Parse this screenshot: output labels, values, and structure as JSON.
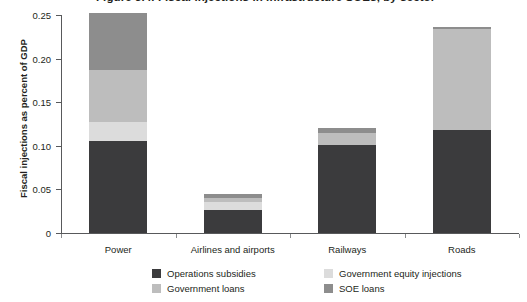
{
  "figure": {
    "title": "Figure 3.4. Fiscal injections in infrastructure SOEs, by sector",
    "title_bullet": "",
    "y_axis_title": "Fiscal injections as percent of GDP"
  },
  "chart_data": {
    "type": "bar",
    "stacked": true,
    "title": "Figure 3.4. Fiscal injections in infrastructure SOEs, by sector",
    "xlabel": "",
    "ylabel": "Fiscal injections as percent of GDP",
    "ylim": [
      0,
      0.25
    ],
    "grid": false,
    "legend_position": "bottom",
    "categories": [
      "Power",
      "Airlines and airports",
      "Railways",
      "Roads"
    ],
    "ytick_labels": [
      "0",
      "0.05",
      "0.10",
      "0.15",
      "0.20",
      "0.25"
    ],
    "ytick_values": [
      0,
      0.05,
      0.1,
      0.15,
      0.2,
      0.25
    ],
    "series": [
      {
        "name": "Operations subsidies",
        "color": "#3b3b3d",
        "values": [
          0.105,
          0.026,
          0.101,
          0.118
        ]
      },
      {
        "name": "Government equity injections",
        "color": "#dcdcdc",
        "values": [
          0.022,
          0.009,
          0.0,
          0.0
        ]
      },
      {
        "name": "Government loans",
        "color": "#bdbdbd",
        "values": [
          0.06,
          0.005,
          0.014,
          0.116
        ]
      },
      {
        "name": "SOE loans",
        "color": "#8d8d8d",
        "values": [
          0.065,
          0.005,
          0.006,
          0.002
        ]
      }
    ],
    "totals": [
      0.252,
      0.045,
      0.121,
      0.236
    ]
  }
}
